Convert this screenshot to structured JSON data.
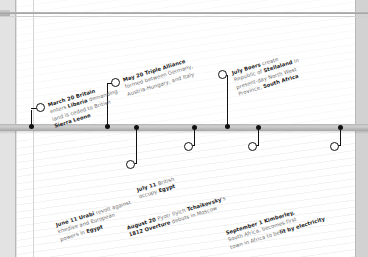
{
  "diagram": {
    "type": "timeline",
    "title_visible": false,
    "year_implied": "1882",
    "axis": {
      "orientation": "horizontal",
      "style": "grey-bar",
      "marker_shapes": [
        "dot-on-axis",
        "open-ring-at-label"
      ]
    },
    "colors": {
      "page": "#ffffff",
      "backdrop": "#d2d2d2",
      "bar": "#b7b7b7",
      "marker": "#111111",
      "body_text": "#6e6e6e",
      "bold_text": "#1a1a1a"
    },
    "events": [
      {
        "id": "march-20-britain-liberia",
        "side": "above",
        "date": "March 20",
        "lines": [
          {
            "bold": "March 20 Britain",
            "plain": ""
          },
          {
            "bold": "",
            "plain": "enters "
          },
          {
            "bold": "Liberia",
            "plain": " demanding"
          },
          {
            "bold": "",
            "plain": "land is ceded to British"
          },
          {
            "bold": "Sierra Leone",
            "plain": ""
          }
        ],
        "text_flat": "March 20 Britain enters Liberia demanding land is ceded to British Sierra Leone",
        "line1_bold": "March 20 Britain",
        "line2_plain_a": "enters ",
        "line2_bold": "Liberia",
        "line2_plain_b": " demanding",
        "line3": "land is ceded to British",
        "line4_bold": "Sierra Leone"
      },
      {
        "id": "may-20-triple-alliance",
        "side": "above",
        "date": "May 20",
        "text_flat": "May 20 Triple Alliance formed between Germany, Austria-Hungary, and Italy",
        "line1_bold": "May 20 Triple Alliance",
        "line2": "formed between Germany,",
        "line3": "Austria-Hungary, and Italy"
      },
      {
        "id": "july-boers-stellaland",
        "side": "above",
        "date": "July",
        "text_flat": "July Boers create Republic of Stellaland in present-day North West Province, South Africa",
        "line1_bold": "July Boers",
        "line1_plain": " create",
        "line2_plain_a": "Republic of ",
        "line2_bold": "Stellaland",
        "line2_plain_b": " in",
        "line3": "present-day North West",
        "line4_plain": "Province, ",
        "line4_bold": "South Africa"
      },
      {
        "id": "june-11-urabi-revolt",
        "side": "below",
        "date": "June 11",
        "text_flat": "June 11 Urabi revolt against khedive and European powers in Egypt",
        "line1_bold": "June 11 Urabi",
        "line1_plain": " revolt against",
        "line2": "khedive and European",
        "line3_plain": "powers in ",
        "line3_bold": "Egypt"
      },
      {
        "id": "july-11-british-occupy-egypt",
        "side": "below",
        "date": "July 11",
        "text_flat": "July 11 British occupy Egypt",
        "line1_bold": "July 11",
        "line1_plain": " British",
        "line2_plain": "occupy ",
        "line2_bold": "Egypt"
      },
      {
        "id": "august-20-1812-overture",
        "side": "below",
        "date": "August 20",
        "text_flat": "August 20 Pyotr Ilyich Tchaikovsky's 1812 Overture debuts in Moscow",
        "line1_bold_a": "August 20",
        "line1_plain_a": " Pyotr Ilyich ",
        "line1_bold_b": "Tchaikovsky",
        "line1_plain_b": "'s",
        "line2_bold": "1812 Overture",
        "line2_plain": " debuts in Moscow"
      },
      {
        "id": "september-1-kimberley-electricity",
        "side": "below",
        "date": "September 1",
        "text_flat": "September 1 Kimberley, South Africa, becomes first town in Africa to be lit by electricity",
        "line1_bold": "September 1 Kimberley,",
        "line2": "South Africa, becomes first",
        "line3_plain": "town in Africa to be",
        "line3_bold": "lit by electricity"
      }
    ]
  }
}
